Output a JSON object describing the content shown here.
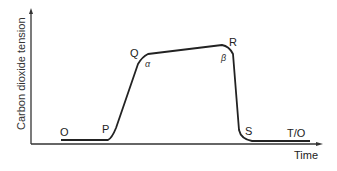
{
  "diagram": {
    "title": "",
    "y_axis_label": "Carbon dioxide tension",
    "x_axis_label": "Time",
    "points": {
      "O": "O",
      "P": "P",
      "Q": "Q",
      "R": "R",
      "S": "S",
      "T": "T/O"
    },
    "angles": {
      "alpha": "α",
      "beta": "β"
    }
  }
}
